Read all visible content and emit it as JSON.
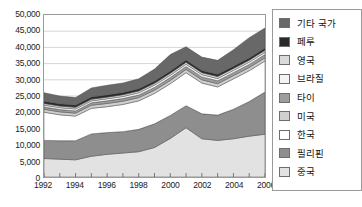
{
  "chart_data": {
    "type": "area",
    "stacked": true,
    "title": "",
    "subtitle": "",
    "xlabel": "",
    "ylabel": "",
    "xlim": [
      1992,
      2006
    ],
    "ylim": [
      0,
      50000
    ],
    "ytick_step": 5000,
    "grid": true,
    "legend_position": "right",
    "x": [
      1992,
      1993,
      1994,
      1995,
      1996,
      1997,
      1998,
      1999,
      2000,
      2001,
      2002,
      2003,
      2004,
      2005,
      2006
    ],
    "xtick_labels": [
      "1992",
      "1994",
      "1996",
      "1998",
      "2000",
      "2002",
      "2004",
      "2006"
    ],
    "ytick_labels": [
      "0",
      "5,000",
      "10,000",
      "15,000",
      "20,000",
      "25,000",
      "30,000",
      "35,000",
      "40,000",
      "45,000",
      "50,000"
    ],
    "series": [
      {
        "name": "중국",
        "color": "#e2e2e2",
        "values": [
          5700,
          5500,
          5300,
          6400,
          7000,
          7400,
          7800,
          9100,
          11900,
          15200,
          11800,
          11300,
          11800,
          12600,
          13200
        ]
      },
      {
        "name": "필리핀",
        "color": "#8e8e8e",
        "values": [
          5600,
          5700,
          5900,
          6900,
          6700,
          6600,
          6900,
          7300,
          7100,
          6800,
          7700,
          7800,
          9100,
          10700,
          13000
        ]
      },
      {
        "name": "한국",
        "color": "#ffffff",
        "values": [
          8700,
          8000,
          7600,
          7900,
          8000,
          8400,
          8800,
          9400,
          9800,
          10200,
          9500,
          8700,
          9400,
          9500,
          9600
        ]
      },
      {
        "name": "미국",
        "color": "#cfcfcf",
        "values": [
          900,
          900,
          900,
          950,
          1000,
          1000,
          1000,
          1000,
          1000,
          1000,
          1000,
          1000,
          1000,
          1000,
          1000
        ]
      },
      {
        "name": "타이",
        "color": "#9d9d9d",
        "values": [
          700,
          700,
          700,
          750,
          800,
          800,
          800,
          850,
          900,
          900,
          900,
          900,
          900,
          950,
          1000
        ]
      },
      {
        "name": "브라질",
        "color": "#f4f4f4",
        "values": [
          600,
          600,
          600,
          600,
          650,
          650,
          700,
          700,
          700,
          700,
          700,
          700,
          700,
          700,
          700
        ]
      },
      {
        "name": "영국",
        "color": "#dadada",
        "values": [
          500,
          500,
          500,
          500,
          500,
          550,
          550,
          550,
          600,
          600,
          600,
          600,
          600,
          600,
          600
        ]
      },
      {
        "name": "페루",
        "color": "#2a2a2a",
        "values": [
          700,
          700,
          700,
          700,
          700,
          700,
          700,
          700,
          700,
          700,
          700,
          700,
          700,
          700,
          700
        ]
      },
      {
        "name": "기타 국가",
        "color": "#686868",
        "values": [
          2600,
          2400,
          2300,
          2800,
          2950,
          2900,
          3050,
          3700,
          5100,
          4100,
          4100,
          4300,
          5100,
          6250,
          6200
        ]
      }
    ],
    "legend_entries": [
      {
        "label": "기타 국가",
        "color": "#686868"
      },
      {
        "label": "페루",
        "color": "#2a2a2a"
      },
      {
        "label": "영국",
        "color": "#dadada"
      },
      {
        "label": "브라질",
        "color": "#f4f4f4"
      },
      {
        "label": "타이",
        "color": "#9d9d9d"
      },
      {
        "label": "미국",
        "color": "#cfcfcf"
      },
      {
        "label": "한국",
        "color": "#ffffff"
      },
      {
        "label": "필리핀",
        "color": "#8e8e8e"
      },
      {
        "label": "중국",
        "color": "#e2e2e2"
      }
    ]
  },
  "footnote": ""
}
